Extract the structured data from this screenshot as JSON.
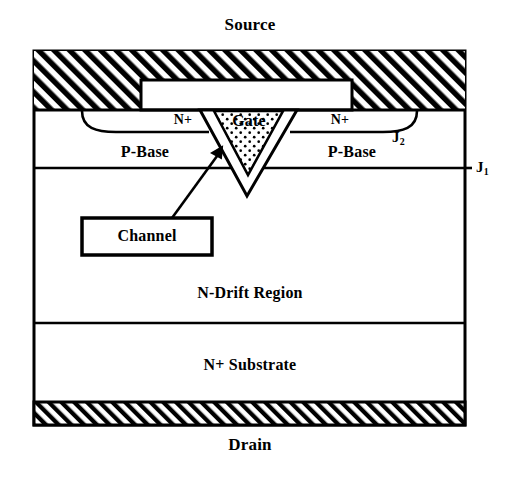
{
  "figure": {
    "title_top": "Source",
    "title_bottom": "Drain",
    "colors": {
      "line": "#000000",
      "background": "#ffffff",
      "hatch_fill": "#000000",
      "gate_stipple": "#000000"
    }
  },
  "terminals": {
    "source_label": "Source",
    "drain_label": "Drain"
  },
  "regions": {
    "source_metal": "Source",
    "gate": "Gate",
    "n_plus_left": "N+",
    "n_plus_right": "N+",
    "p_base_left": "P-Base",
    "p_base_right": "P-Base",
    "n_drift": "N-Drift Region",
    "n_substrate": "N+ Substrate",
    "drain_metal": "Drain"
  },
  "callouts": {
    "channel": "Channel"
  },
  "junctions": {
    "j2_letter": "J",
    "j2_sub": "2",
    "j1_letter": "J",
    "j1_sub": "1"
  }
}
